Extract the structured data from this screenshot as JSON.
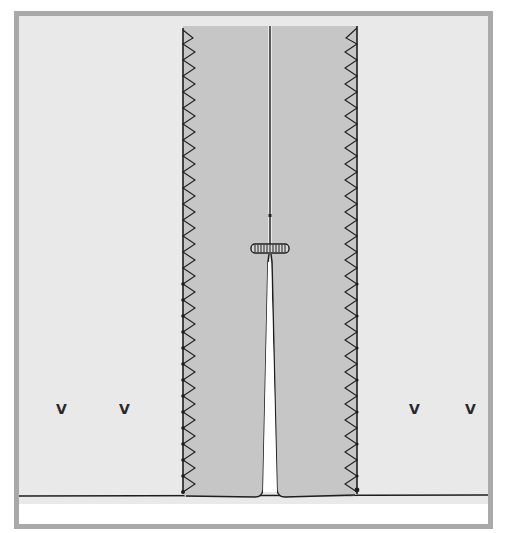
{
  "figure": {
    "colors": {
      "frame_border": "#a9a9a9",
      "background": "#e9e9e9",
      "fabric": "#c6c6c6",
      "stitch": "#1e1e1e",
      "lower_panel": "#ffffff"
    },
    "fabric_strip": {
      "left": 183,
      "right": 357,
      "top": 26,
      "bottom": 494
    },
    "center_seam": {
      "x": 270,
      "top": 26,
      "bar_tack_y": 248
    },
    "slit": {
      "start_y": 262,
      "bottom_y": 494,
      "bottom_half_width": 8
    },
    "bar_tack": {
      "x": 251,
      "y": 244,
      "width": 38,
      "height": 9
    },
    "notches": [
      {
        "label": "V",
        "x": 60,
        "y": 402
      },
      {
        "label": "V",
        "x": 122,
        "y": 402
      },
      {
        "label": "V",
        "x": 411,
        "y": 402
      },
      {
        "label": "V",
        "x": 468,
        "y": 402
      }
    ],
    "baseline_y": 496
  }
}
